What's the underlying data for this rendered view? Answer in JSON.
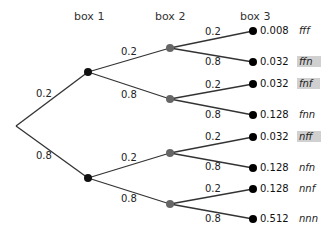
{
  "headers": {
    "box1": "box 1",
    "box2": "box 2",
    "box3": "box 3"
  },
  "colors": {
    "node_box1": "#111111",
    "node_box2": "#666666",
    "leaf": "#000000",
    "edge": "#333333",
    "highlight": "#d0d0d0"
  },
  "edges": {
    "root_top": "0.2",
    "root_bottom": "0.8",
    "b1t_up": "0.2",
    "b1t_down": "0.8",
    "b1b_up": "0.2",
    "b1b_down": "0.8",
    "l1": "0.2",
    "l2": "0.8",
    "l3": "0.2",
    "l4": "0.8",
    "l5": "0.2",
    "l6": "0.8",
    "l7": "0.2",
    "l8": "0.8"
  },
  "leaves": [
    {
      "prob": "0.008",
      "outcome": "fff",
      "highlighted": false
    },
    {
      "prob": "0.032",
      "outcome": "ffn",
      "highlighted": true
    },
    {
      "prob": "0.032",
      "outcome": "fnf",
      "highlighted": true
    },
    {
      "prob": "0.128",
      "outcome": "fnn",
      "highlighted": false
    },
    {
      "prob": "0.032",
      "outcome": "nff",
      "highlighted": true
    },
    {
      "prob": "0.128",
      "outcome": "nfn",
      "highlighted": false
    },
    {
      "prob": "0.128",
      "outcome": "nnf",
      "highlighted": false
    },
    {
      "prob": "0.512",
      "outcome": "nnn",
      "highlighted": false
    }
  ]
}
